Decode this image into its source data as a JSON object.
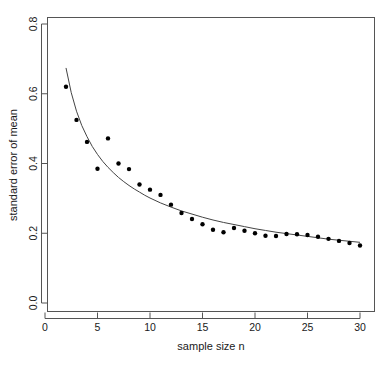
{
  "chart_data": {
    "type": "scatter",
    "title": "",
    "xlabel": "sample size n",
    "ylabel": "standard error of mean",
    "xlim": [
      0,
      31.2
    ],
    "ylim": [
      -0.03,
      0.835
    ],
    "xticks": [
      0,
      5,
      10,
      15,
      20,
      25,
      30
    ],
    "xtick_labels": [
      "0",
      "5",
      "10",
      "15",
      "20",
      "25",
      "30"
    ],
    "yticks": [
      0.0,
      0.2,
      0.4,
      0.6,
      0.8
    ],
    "ytick_labels": [
      "0.0",
      "0.2",
      "0.4",
      "0.6",
      "0.8"
    ],
    "grid": false,
    "legend": false,
    "legend_position": "none",
    "point_color": "#000000",
    "curve_color": "#444444",
    "axis_color": "#555555",
    "background_color": "#ffffff",
    "series": [
      {
        "name": "observed standard error of mean",
        "type": "scatter",
        "marker": "filled-circle",
        "marker_size": 2.2,
        "x": [
          2,
          3,
          4,
          5,
          6,
          7,
          8,
          9,
          10,
          11,
          12,
          13,
          14,
          15,
          16,
          17,
          18,
          19,
          20,
          21,
          22,
          23,
          24,
          25,
          26,
          27,
          28,
          29,
          30
        ],
        "values": [
          0.62,
          0.525,
          0.462,
          0.385,
          0.472,
          0.4,
          0.384,
          0.34,
          0.325,
          0.31,
          0.282,
          0.258,
          0.241,
          0.226,
          0.21,
          0.203,
          0.215,
          0.207,
          0.2,
          0.193,
          0.192,
          0.198,
          0.197,
          0.195,
          0.19,
          0.184,
          0.178,
          0.172,
          0.165
        ]
      },
      {
        "name": "theoretical sigma over sqrt(n)",
        "type": "line",
        "x": [
          2,
          2.5,
          3,
          3.5,
          4,
          4.5,
          5,
          5.5,
          6,
          6.5,
          7,
          7.5,
          8,
          8.5,
          9,
          9.5,
          10,
          11,
          12,
          13,
          14,
          15,
          16,
          17,
          18,
          19,
          20,
          21,
          22,
          23,
          24,
          25,
          26,
          27,
          28,
          29,
          30
        ],
        "values": [
          0.674,
          0.603,
          0.55,
          0.509,
          0.477,
          0.449,
          0.426,
          0.406,
          0.389,
          0.374,
          0.36,
          0.348,
          0.337,
          0.327,
          0.318,
          0.309,
          0.301,
          0.287,
          0.275,
          0.264,
          0.255,
          0.246,
          0.238,
          0.231,
          0.225,
          0.219,
          0.213,
          0.208,
          0.203,
          0.199,
          0.195,
          0.191,
          0.187,
          0.183,
          0.18,
          0.177,
          0.174
        ]
      }
    ]
  },
  "axes": {
    "x_axis_name": "sample-size-axis",
    "y_axis_name": "standard-error-axis"
  }
}
